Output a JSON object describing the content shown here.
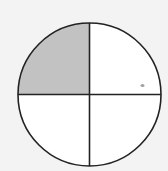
{
  "diagram": {
    "shape": "circle",
    "parts_total": 4,
    "parts_shaded": 1,
    "shaded_quadrant": "top-left",
    "fraction_shaded": "1/4",
    "colors": {
      "background": "#f3f3f3",
      "shade": "#c2c2c2",
      "stroke": "#222222",
      "unshaded": "#ffffff",
      "artifact": "#8a8a8a"
    }
  }
}
